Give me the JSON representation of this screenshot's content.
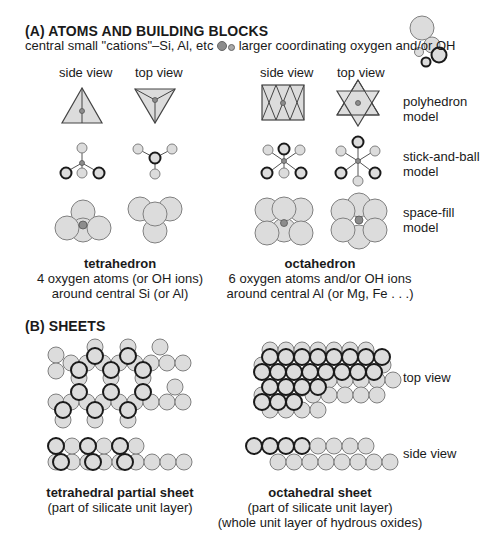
{
  "section_a": {
    "heading": "(A) ATOMS AND BUILDING BLOCKS",
    "legend_text_before": "central small \"cations\"–Si, Al, etc",
    "legend_text_after": "larger coordinating oxygen and/or OH",
    "colors": {
      "atom_fill": "#dcdcdc",
      "atom_stroke": "#808080",
      "cation_fill": "#8c8c8c",
      "bold_stroke": "#1a1a1a"
    },
    "tetrahedron": {
      "side_view_label": "side view",
      "top_view_label": "top view",
      "name": "tetrahedron",
      "desc_line1": "4 oxygen atoms (or OH ions)",
      "desc_line2": "around central Si (or Al)"
    },
    "octahedron": {
      "side_view_label": "side view",
      "top_view_label": "top view",
      "name": "octahedron",
      "desc_line1": "6 oxygen atoms and/or OH ions",
      "desc_line2": "around central Al (or Mg, Fe . . .)"
    },
    "row_labels": {
      "polyhedron_1": "polyhedron",
      "polyhedron_2": "model",
      "stickball_1": "stick-and-ball",
      "stickball_2": "model",
      "spacefill_1": "space-fill",
      "spacefill_2": "model"
    }
  },
  "section_b": {
    "heading": "(B) SHEETS",
    "top_view_label": "top view",
    "side_view_label": "side view",
    "tetrahedral": {
      "name": "tetrahedral partial sheet",
      "desc_line1": "(part of silicate unit layer)"
    },
    "octahedral": {
      "name": "octahedral sheet",
      "desc_line1": "(part of silicate unit layer)",
      "desc_line2": "(whole unit layer of hydrous oxides)"
    }
  }
}
